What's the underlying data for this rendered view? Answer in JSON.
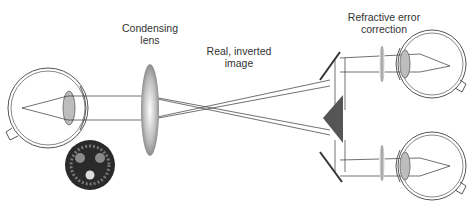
{
  "diagram": {
    "labels": {
      "condensing_lens": [
        "Condensing",
        "lens"
      ],
      "image": [
        "Real, inverted",
        "image"
      ],
      "correction": [
        "Refractive error",
        "correction"
      ]
    },
    "colors": {
      "line": "#333333",
      "eye_outline": "#555555",
      "prism": "#555555",
      "lens_shade": "#9a9a9a",
      "fundus_bg": "#2a2a2a",
      "fundus_spot": "#8a8a8a"
    }
  }
}
